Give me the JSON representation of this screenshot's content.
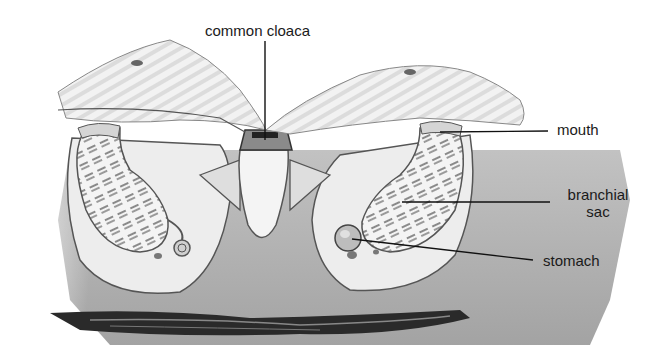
{
  "figure": {
    "type": "anatomical-illustration"
  },
  "labels": {
    "common_cloaca": "common cloaca",
    "mouth": "mouth",
    "branchial_sac_line1": "branchial",
    "branchial_sac_line2": "sac",
    "stomach": "stomach"
  },
  "colors": {
    "tunic": "#a9a9a9",
    "tissue": "#e6e6e6",
    "outline": "#3a3a3a",
    "substrate": "#2a2a2a",
    "text": "#1a1a1a"
  }
}
